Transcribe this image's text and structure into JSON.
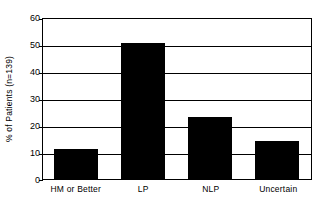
{
  "chart_data": {
    "type": "bar",
    "title": "",
    "subtitle": "",
    "xlabel": "",
    "ylabel": "% of Patients (n=139)",
    "categories": [
      "HM or Better",
      "LP",
      "NLP",
      "Uncertain"
    ],
    "values": [
      11.2,
      51.4,
      23.3,
      14.5
    ],
    "series": [
      {
        "name": "% of Patients",
        "values": [
          11.2,
          51.4,
          23.3,
          14.5
        ]
      }
    ],
    "ylim": [
      0,
      60
    ],
    "yticks": [
      0,
      10,
      20,
      30,
      40,
      50,
      60
    ],
    "ytick_labels": [
      "0",
      "10",
      "20",
      "30",
      "40",
      "50",
      "60"
    ],
    "grid": true,
    "grid_axis": "y",
    "legend": false,
    "legend_position": "none",
    "bar_color": "#000000",
    "background_color": "#ffffff",
    "axis_color": "#000000",
    "annotations": [],
    "sample_size_note": "n=139"
  },
  "axes": {
    "y_title": "% of Patients (n=139)",
    "tick_0": "0",
    "tick_10": "10",
    "tick_20": "20",
    "tick_30": "30",
    "tick_40": "40",
    "tick_50": "50",
    "tick_60": "60"
  },
  "xaxis": {
    "cat_0": "HM or Better",
    "cat_1": "LP",
    "cat_2": "NLP",
    "cat_3": "Uncertain"
  }
}
